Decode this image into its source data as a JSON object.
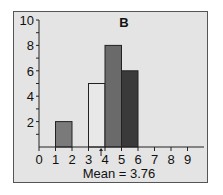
{
  "chart_data": {
    "type": "bar",
    "title": "B",
    "xlabel": "Mean = 3.76",
    "ylabel": "",
    "x_ticks": [
      "0",
      "1",
      "2",
      "3",
      "4",
      "5",
      "6",
      "7",
      "8",
      "9"
    ],
    "y_ticks": [
      "2",
      "4",
      "6",
      "8",
      "10"
    ],
    "ylim": [
      0,
      10
    ],
    "xlim": [
      0,
      10
    ],
    "grid": false,
    "bins": [
      {
        "start": 1,
        "end": 2,
        "value": 2,
        "color": "#7a7a7a"
      },
      {
        "start": 3,
        "end": 4,
        "value": 5,
        "color": "#e8e8e8"
      },
      {
        "start": 4,
        "end": 5,
        "value": 8,
        "color": "#6a6a6a"
      },
      {
        "start": 5,
        "end": 6,
        "value": 6,
        "color": "#3a3a3a"
      }
    ],
    "mean_marker": 3.76,
    "annotations": [
      "Mean = 3.76"
    ]
  }
}
